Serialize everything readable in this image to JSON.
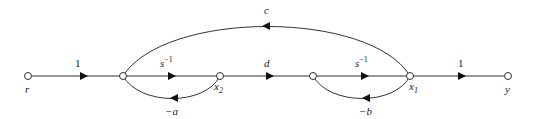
{
  "diagram": {
    "type": "signal-flow-graph",
    "nodes": [
      {
        "id": "r",
        "label": "r"
      },
      {
        "id": "n1",
        "label": ""
      },
      {
        "id": "x2",
        "label": "x",
        "sub": "2"
      },
      {
        "id": "n3",
        "label": ""
      },
      {
        "id": "x1",
        "label": "x",
        "sub": "1"
      },
      {
        "id": "y",
        "label": "y"
      }
    ],
    "edges": [
      {
        "from": "r",
        "to": "n1",
        "gain": "1"
      },
      {
        "from": "n1",
        "to": "x2",
        "gain": "s",
        "sup": "−1"
      },
      {
        "from": "x2",
        "to": "n1",
        "gain": "−a"
      },
      {
        "from": "x2",
        "to": "n3",
        "gain": "d"
      },
      {
        "from": "n3",
        "to": "x1",
        "gain": "s",
        "sup": "−1"
      },
      {
        "from": "x1",
        "to": "n3",
        "gain": "−b"
      },
      {
        "from": "x1",
        "to": "n1",
        "gain": "c"
      },
      {
        "from": "x1",
        "to": "y",
        "gain": "1"
      }
    ]
  }
}
